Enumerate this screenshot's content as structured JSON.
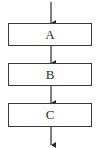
{
  "diagram": {
    "type": "flowchart",
    "direction": "top-to-bottom",
    "nodes": [
      {
        "id": "A",
        "label": "A"
      },
      {
        "id": "B",
        "label": "B"
      },
      {
        "id": "C",
        "label": "C"
      }
    ],
    "edges": [
      {
        "from": "start",
        "to": "A"
      },
      {
        "from": "A",
        "to": "B"
      },
      {
        "from": "B",
        "to": "C"
      },
      {
        "from": "C",
        "to": "end"
      }
    ],
    "colors": {
      "stroke": "#3a3a3a",
      "background": "#ffffff"
    }
  }
}
